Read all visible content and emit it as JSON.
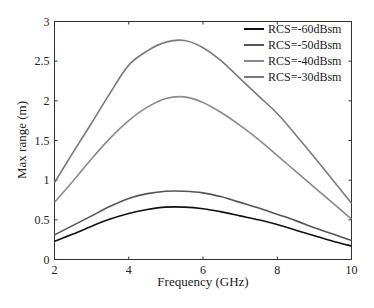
{
  "chart_data": {
    "type": "line",
    "title": "",
    "xlabel": "Frequency (GHz)",
    "ylabel": "Max range (m)",
    "xlim": [
      2,
      10
    ],
    "ylim": [
      0,
      3
    ],
    "xticks": [
      2,
      4,
      6,
      8,
      10
    ],
    "xtick_labels": [
      "2",
      "4",
      "6",
      "8",
      "10"
    ],
    "yticks": [
      0,
      0.5,
      1,
      1.5,
      2,
      2.5,
      3
    ],
    "ytick_labels": [
      "0",
      "0.5",
      "1",
      "1.5",
      "2",
      "2.5",
      "3"
    ],
    "grid": false,
    "legend_position": "top-right",
    "x": [
      2,
      2.5,
      3,
      3.5,
      4,
      4.5,
      5,
      5.5,
      6,
      6.5,
      7,
      7.5,
      8,
      8.5,
      9,
      9.5,
      10
    ],
    "series": [
      {
        "name": "RCS=-60dBsm",
        "color": "#111111",
        "values": [
          0.23,
          0.32,
          0.42,
          0.51,
          0.58,
          0.63,
          0.66,
          0.66,
          0.64,
          0.6,
          0.55,
          0.5,
          0.44,
          0.37,
          0.3,
          0.23,
          0.17
        ]
      },
      {
        "name": "RCS=-50dBsm",
        "color": "#555555",
        "values": [
          0.31,
          0.43,
          0.55,
          0.67,
          0.77,
          0.83,
          0.86,
          0.86,
          0.84,
          0.79,
          0.72,
          0.65,
          0.57,
          0.49,
          0.4,
          0.32,
          0.24
        ]
      },
      {
        "name": "RCS=-40dBsm",
        "color": "#8a8a8a",
        "values": [
          0.72,
          0.99,
          1.27,
          1.53,
          1.75,
          1.92,
          2.03,
          2.05,
          1.98,
          1.85,
          1.69,
          1.51,
          1.31,
          1.11,
          0.91,
          0.71,
          0.51
        ]
      },
      {
        "name": "RCS=-30dBsm",
        "color": "#7a7a7a",
        "values": [
          0.97,
          1.35,
          1.72,
          2.1,
          2.45,
          2.63,
          2.74,
          2.76,
          2.67,
          2.5,
          2.28,
          2.06,
          1.84,
          1.57,
          1.29,
          1.0,
          0.71
        ]
      }
    ]
  }
}
